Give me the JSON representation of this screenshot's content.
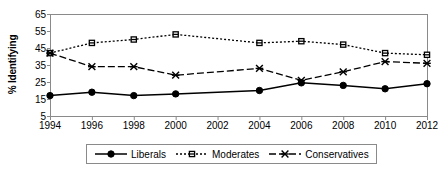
{
  "chart_data": {
    "type": "line",
    "title": "",
    "xlabel": "",
    "ylabel": "% Identifying",
    "x": [
      1994,
      1996,
      1998,
      2000,
      2002,
      2004,
      2006,
      2008,
      2010,
      2012
    ],
    "categories": [
      "1994",
      "1996",
      "1998",
      "2000",
      "2002",
      "2004",
      "2006",
      "2008",
      "2010",
      "2012"
    ],
    "xlim": [
      1994,
      2012
    ],
    "ylim": [
      5,
      65
    ],
    "ytick_labels": [
      "65",
      "55",
      "45",
      "35",
      "25",
      "15",
      "5"
    ],
    "ytick_values": [
      65,
      55,
      45,
      35,
      25,
      15,
      5
    ],
    "grid": false,
    "legend_position": "bottom",
    "series": [
      {
        "name": "Liberals",
        "marker": "filled-circle",
        "line_style": "solid",
        "color": "#000000",
        "x": [
          1994,
          1996,
          1998,
          2000,
          2004,
          2006,
          2008,
          2010,
          2012
        ],
        "values": [
          17,
          19,
          17,
          18,
          20,
          24.5,
          23,
          21,
          24
        ]
      },
      {
        "name": "Moderates",
        "marker": "square",
        "line_style": "dotted",
        "color": "#000000",
        "x": [
          1994,
          1996,
          1998,
          2000,
          2004,
          2006,
          2008,
          2010,
          2012
        ],
        "values": [
          42,
          48,
          50,
          53,
          48,
          49,
          47,
          42,
          41
        ]
      },
      {
        "name": "Conservatives",
        "marker": "x",
        "line_style": "dashed",
        "color": "#000000",
        "x": [
          1994,
          1996,
          1998,
          2000,
          2004,
          2006,
          2008,
          2010,
          2012
        ],
        "values": [
          42,
          34,
          34,
          29,
          33,
          26,
          31,
          37,
          36
        ]
      }
    ]
  },
  "legend": {
    "items": [
      {
        "label": "Liberals"
      },
      {
        "label": "Moderates"
      },
      {
        "label": "Conservatives"
      }
    ]
  },
  "axes": {
    "y_title": "% Identifying"
  }
}
